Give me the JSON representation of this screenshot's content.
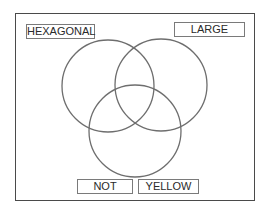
{
  "diagram": {
    "type": "venn",
    "stroke_color": "#6e6e6e",
    "frame_color": "#4a4a4a",
    "labels": {
      "top_left": "HEXAGONAL",
      "top_right": "LARGE",
      "bottom_left": "NOT",
      "bottom_right": "YELLOW"
    },
    "circles": [
      {
        "name": "left",
        "cx": 108,
        "cy": 86,
        "r": 46
      },
      {
        "name": "right",
        "cx": 161,
        "cy": 85,
        "r": 46
      },
      {
        "name": "bottom",
        "cx": 135,
        "cy": 131,
        "r": 46
      }
    ]
  }
}
